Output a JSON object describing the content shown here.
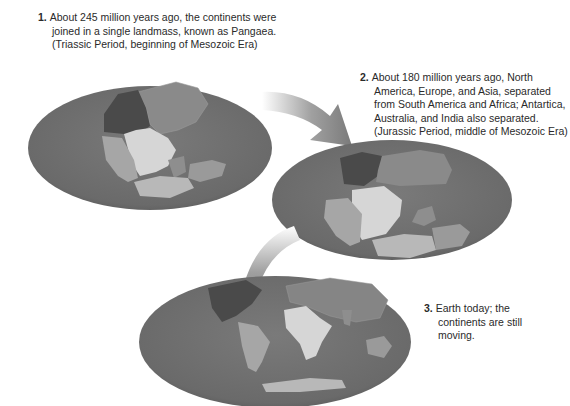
{
  "figure": {
    "stages": [
      {
        "number": "1.",
        "text": "About 245 million years ago, the continents were joined in a single landmass, known as Pangaea. (Triassic Period, beginning of Mesozoic Era)"
      },
      {
        "number": "2.",
        "text": "About 180 million years ago, North America, Europe, and Asia, separated from South America and Africa; Antartica, Australia, and India also separated. (Jurassic Period, middle of Mesozoic Era)"
      },
      {
        "number": "3.",
        "text": "Earth today; the continents are still moving."
      }
    ],
    "colors": {
      "ocean": "#6e6e6e",
      "north_america": "#4a4a4a",
      "eurasia": "#8a8a8a",
      "africa": "#d6d6d6",
      "south_america": "#a6a6a6",
      "antarctica": "#b8b8b8",
      "australia_india": "#9a9a9a",
      "arrow": "#8c8c8c"
    }
  }
}
